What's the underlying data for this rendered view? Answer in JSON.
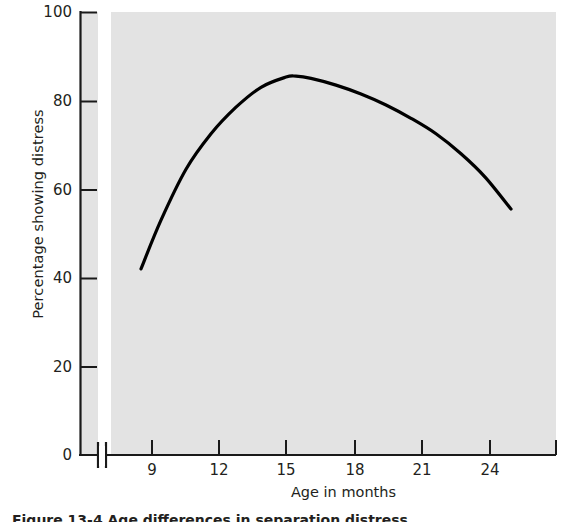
{
  "figure": {
    "caption": "Figure 13-4  Age differences in separation distress"
  },
  "chart_data": {
    "type": "line",
    "title": "",
    "xlabel": "Age in months",
    "ylabel": "Percentage showing distress",
    "xlim": [
      8,
      25.8
    ],
    "ylim": [
      0,
      100
    ],
    "xticks": [
      9,
      12,
      15,
      18,
      21,
      24
    ],
    "xticklabels": [
      "9",
      "12",
      "15",
      "18",
      "21",
      "24"
    ],
    "yticks": [
      0,
      20,
      40,
      60,
      80,
      100
    ],
    "yticklabels": [
      "0",
      "20",
      "40",
      "60",
      "80",
      "100"
    ],
    "grid": false,
    "legend": false,
    "axis_break_x": true,
    "plot_background": "#e3e3e3",
    "line_color": "#000000",
    "line_width": 3,
    "series": [
      {
        "name": "Percentage showing distress",
        "x": [
          9.2,
          10,
          11,
          12,
          13,
          14,
          15,
          15.4,
          16,
          17,
          18,
          19,
          20,
          21,
          22,
          23,
          24
        ],
        "y": [
          42,
          53,
          64.5,
          72.5,
          78.5,
          83,
          85.3,
          85.5,
          85,
          83.5,
          81.5,
          79,
          76,
          72.5,
          68,
          62.5,
          55.5
        ]
      }
    ]
  }
}
